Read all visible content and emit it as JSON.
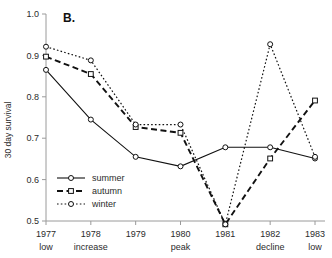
{
  "figure": {
    "panel_label": "B.",
    "background_color": "#ffffff",
    "axis_color": "#9a9a9a",
    "line_color": "#111111"
  },
  "chart_data": {
    "type": "line",
    "title": "",
    "subtitle": "",
    "panel": "B.",
    "xlabel": "",
    "ylabel": "30 day survival",
    "x_tick_labels": [
      "1977",
      "1978",
      "1979",
      "1980",
      "1981",
      "1982",
      "1983"
    ],
    "x_tick_sublabels": [
      "low",
      "increase",
      "",
      "peak",
      "",
      "decline",
      "low"
    ],
    "categories": [
      "1977",
      "1978",
      "1979",
      "1980",
      "1981",
      "1982",
      "1983"
    ],
    "y_tick_labels": [
      "0.5",
      "0.6",
      "0.7",
      "0.8",
      "0.9",
      "1.0"
    ],
    "y_ticks": [
      0.5,
      0.6,
      0.7,
      0.8,
      0.9,
      1.0
    ],
    "ylim": [
      0.5,
      1.0
    ],
    "xlim": [
      0,
      6
    ],
    "grid": false,
    "legend_position": "lower-left",
    "series": [
      {
        "name": "summer",
        "line_style": "solid",
        "marker": "circle",
        "values": [
          0.865,
          0.745,
          0.655,
          0.632,
          0.678,
          0.678,
          0.651
        ]
      },
      {
        "name": "autumn",
        "line_style": "dashed",
        "marker": "square",
        "values": [
          0.897,
          0.855,
          0.727,
          0.713,
          0.492,
          0.651,
          0.791
        ]
      },
      {
        "name": "winter",
        "line_style": "dotted",
        "marker": "circle",
        "values": [
          0.921,
          0.888,
          0.733,
          0.733,
          0.492,
          0.927,
          0.655
        ]
      }
    ]
  },
  "legend": {
    "entries": [
      {
        "label": "summer",
        "style": "solid",
        "marker": "circle"
      },
      {
        "label": "autumn",
        "style": "dashed",
        "marker": "square"
      },
      {
        "label": "winter",
        "style": "dotted",
        "marker": "circle"
      }
    ]
  }
}
